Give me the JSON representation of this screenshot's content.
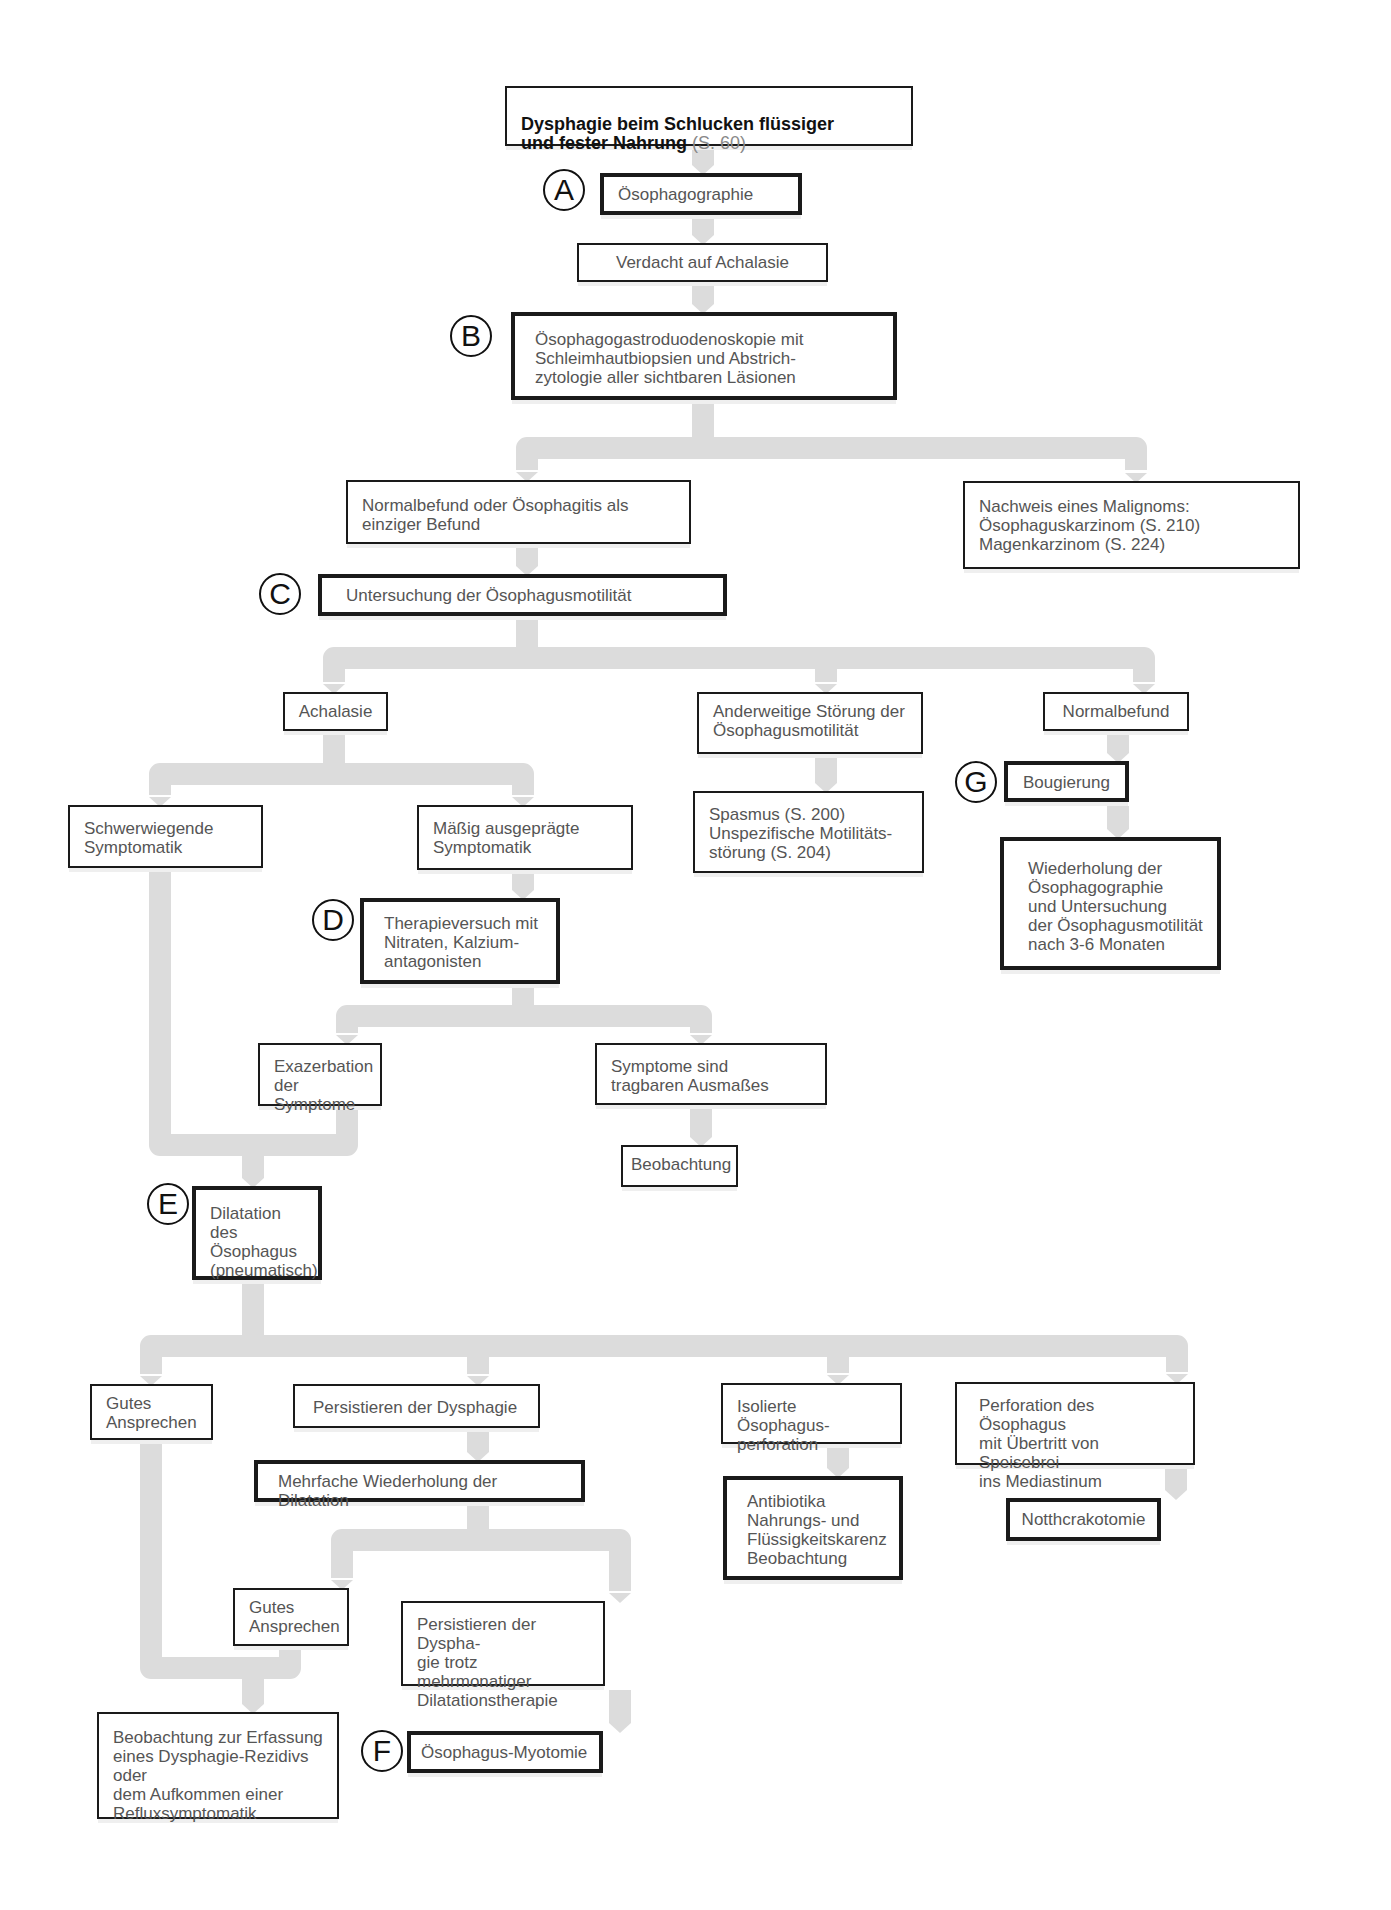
{
  "title": "Dysphagie beim Schlucken flüssiger und fester Nahrung",
  "colors": {
    "box_border": "#1a1a1a",
    "box_text": "#555555",
    "connector": "#dcdcdc",
    "badge": "#111111"
  },
  "nodes": {
    "start": {
      "text": "Dysphagie beim Schlucken flüssiger\nund fester Nahrung ",
      "ref": "(S. 60)"
    },
    "oesophagographie": {
      "text": "Ösophagographie",
      "badge": "A"
    },
    "verdacht": {
      "text": "Verdacht auf Achalasie"
    },
    "ogd": {
      "text": "Ösophagogastroduodenoskopie mit\nSchleimhautbiopsien und Abstrich-\nzytologie aller sichtbaren Läsionen",
      "badge": "B"
    },
    "normalbefund_oesophagitis": {
      "text": "Normalbefund oder Ösophagitis als\neinziger Befund"
    },
    "malignom": {
      "text": "Nachweis eines Malignoms:\n  Ösophaguskarzinom (S. 210)\n  Magenkarzinom (S. 224)"
    },
    "motilitaet": {
      "text": "Untersuchung der Ösophagusmotilität",
      "badge": "C"
    },
    "achalasie": {
      "text": "Achalasie"
    },
    "anderweitige": {
      "text": "Anderweitige Störung der\nÖsophagusmotilität"
    },
    "normalbefund": {
      "text": "Normalbefund"
    },
    "schwerwiegend": {
      "text": "Schwerwiegende\nSymptomatik"
    },
    "maessig": {
      "text": "Mäßig ausgeprägte\nSymptomatik"
    },
    "spasmus": {
      "text": "Spasmus (S. 200)\nUnspezifische Motilitäts-\n  störung (S. 204)"
    },
    "bougierung": {
      "text": "Bougierung",
      "badge": "G"
    },
    "wiederholung": {
      "text": "Wiederholung der\nÖsophagographie\nund Untersuchung\nder Ösophagusmotilität\nnach 3-6 Monaten"
    },
    "therapieversuch": {
      "text": "Therapieversuch mit\nNitraten, Kalzium-\nantagonisten",
      "badge": "D"
    },
    "exazerbation": {
      "text": "Exazerbation\nder Symptome"
    },
    "tragbar": {
      "text": "Symptome sind\ntragbaren Ausmaßes"
    },
    "beobachtung1": {
      "text": "Beobachtung"
    },
    "dilatation": {
      "text": "Dilatation des\nÖsophagus\n(pneumatisch)",
      "badge": "E"
    },
    "gutes1": {
      "text": "Gutes\nAnsprechen"
    },
    "persistieren1": {
      "text": "Persistieren der Dysphagie"
    },
    "isolierte": {
      "text": "Isolierte Ösophagus-\nperforation"
    },
    "perforation": {
      "text": "Perforation des Ösophagus\nmit Übertritt von Speisebrei\nins Mediastinum"
    },
    "mehrfache": {
      "text": "Mehrfache Wiederholung der Dilatation"
    },
    "antibiotika": {
      "text": "Antibiotika\nNahrungs- und\n  Flüssigkeitskarenz\nBeobachtung"
    },
    "notthorakotomie": {
      "text": "Notthcrakotomie"
    },
    "gutes2": {
      "text": "Gutes\nAnsprechen"
    },
    "persistieren2": {
      "text": "Persistieren der Dyspha-\ngie trotz mehrmonatiger\nDilatationstherapie"
    },
    "beobachtung_final": {
      "text": "Beobachtung zur Erfassung\neines Dysphagie-Rezidivs oder\ndem Aufkommen einer\nRefluxsymptomatik"
    },
    "myotomie": {
      "text": "Ösophagus-Myotomie",
      "badge": "F"
    }
  }
}
